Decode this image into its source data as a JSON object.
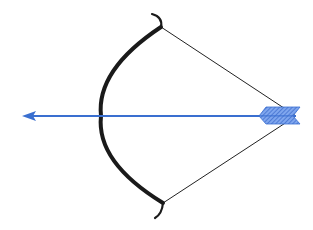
{
  "illustration": {
    "subject": "bow-and-arrow",
    "colors": {
      "background": "#ffffff",
      "bow": "#1a1a1a",
      "string": "#222222",
      "arrow": "#3a6fd0",
      "fletching": "#4a7fe0"
    }
  }
}
